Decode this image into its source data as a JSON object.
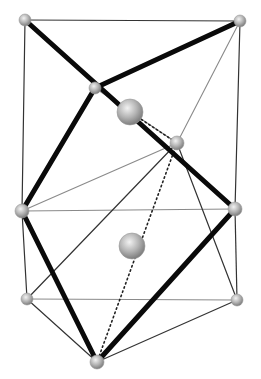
{
  "diagram": {
    "type": "crystal-polyhedron",
    "colors": {
      "background": "#ffffff",
      "thick_edge": "#0a0a0a",
      "thin_edge": "#333333",
      "gray_edge": "#8a8a8a",
      "dotted_edge": "#222222",
      "atom_light": "#e6e6e6",
      "atom_dark": "#8c8c8c"
    },
    "atoms": [
      {
        "id": "top-left",
        "x": 25,
        "y": 20,
        "r": 6
      },
      {
        "id": "top-right",
        "x": 240,
        "y": 21,
        "r": 6
      },
      {
        "id": "upper-middle",
        "x": 95,
        "y": 88,
        "r": 6
      },
      {
        "id": "large-upper",
        "x": 130,
        "y": 112,
        "r": 13
      },
      {
        "id": "right-middle",
        "x": 177,
        "y": 143,
        "r": 7
      },
      {
        "id": "left",
        "x": 22,
        "y": 211,
        "r": 7
      },
      {
        "id": "right",
        "x": 235,
        "y": 209,
        "r": 7
      },
      {
        "id": "large-center",
        "x": 132,
        "y": 246,
        "r": 13
      },
      {
        "id": "lower-left",
        "x": 27,
        "y": 299,
        "r": 6
      },
      {
        "id": "lower-right",
        "x": 237,
        "y": 300,
        "r": 6
      },
      {
        "id": "bottom",
        "x": 97,
        "y": 362,
        "r": 7
      }
    ],
    "edges": [
      {
        "from": "top-left",
        "to": "top-right",
        "style": "thin"
      },
      {
        "from": "top-left",
        "to": "left",
        "style": "thin"
      },
      {
        "from": "top-right",
        "to": "right",
        "style": "thin"
      },
      {
        "from": "top-right",
        "to": "right-middle",
        "style": "gray"
      },
      {
        "from": "upper-middle",
        "to": "right-middle",
        "style": "gray"
      },
      {
        "from": "left",
        "to": "right",
        "style": "gray"
      },
      {
        "from": "left",
        "to": "right-middle",
        "style": "gray"
      },
      {
        "from": "lower-left",
        "to": "right-middle",
        "style": "thin"
      },
      {
        "from": "right-middle",
        "to": "lower-right",
        "style": "thin"
      },
      {
        "from": "left",
        "to": "lower-left",
        "style": "thin"
      },
      {
        "from": "right",
        "to": "lower-right",
        "style": "thin"
      },
      {
        "from": "lower-left",
        "to": "lower-right",
        "style": "gray"
      },
      {
        "from": "lower-left",
        "to": "bottom",
        "style": "thin"
      },
      {
        "from": "lower-right",
        "to": "bottom",
        "style": "thin"
      },
      {
        "from": "right-middle",
        "to": "bottom",
        "style": "dotted"
      },
      {
        "from": "large-upper",
        "to": "right-middle",
        "style": "dotted"
      },
      {
        "from": "top-left",
        "to": "right",
        "style": "thick"
      },
      {
        "from": "top-right",
        "to": "upper-middle",
        "style": "thick"
      },
      {
        "from": "upper-middle",
        "to": "left",
        "style": "thick"
      },
      {
        "from": "left",
        "to": "bottom",
        "style": "thick"
      },
      {
        "from": "bottom",
        "to": "right",
        "style": "thick"
      }
    ]
  }
}
